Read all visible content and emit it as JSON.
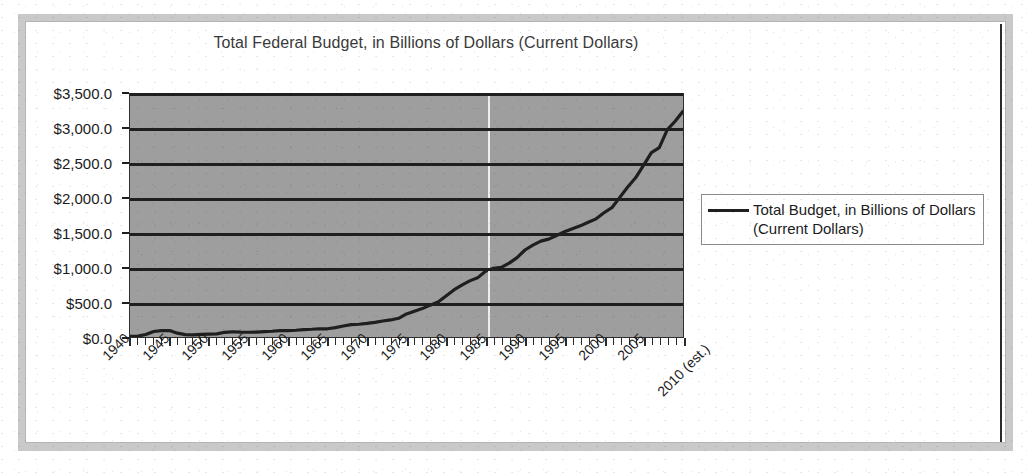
{
  "chart_data": {
    "type": "line",
    "title": "Total Federal Budget, in Billions of Dollars (Current Dollars)",
    "xlabel": "",
    "ylabel": "",
    "ylim": [
      0,
      3500
    ],
    "ytick_step": 500,
    "ytick_labels": [
      "$3,500.0",
      "$3,000.0",
      "$2,500.0",
      "$2,000.0",
      "$1,500.0",
      "$1,000.0",
      "$500.0",
      "$0.0"
    ],
    "ytick_values": [
      3500,
      3000,
      2500,
      2000,
      1500,
      1000,
      500,
      0
    ],
    "xtick_labels": [
      "1940",
      "1945",
      "1950",
      "1955",
      "1960",
      "1965",
      "1970",
      "1975",
      "1980",
      "1985",
      "1990",
      "1995",
      "2000",
      "2005",
      "2010 (est.)"
    ],
    "grid": "horizontal",
    "legend_position": "right",
    "plot_background": "#9e9e9e",
    "line_color": "#1f1f1f",
    "series": [
      {
        "name": "Total Budget, in Billions of Dollars (Current Dollars)",
        "x": [
          1940,
          1941,
          1942,
          1943,
          1944,
          1945,
          1946,
          1947,
          1948,
          1949,
          1950,
          1951,
          1952,
          1953,
          1954,
          1955,
          1956,
          1957,
          1958,
          1959,
          1960,
          1961,
          1962,
          1963,
          1964,
          1965,
          1966,
          1967,
          1968,
          1969,
          1970,
          1971,
          1972,
          1973,
          1974,
          1975,
          1976,
          1977,
          1978,
          1979,
          1980,
          1981,
          1982,
          1983,
          1984,
          1985,
          1986,
          1987,
          1988,
          1989,
          1990,
          1991,
          1992,
          1993,
          1994,
          1995,
          1996,
          1997,
          1998,
          1999,
          2000,
          2001,
          2002,
          2003,
          2004,
          2005,
          2006,
          2007,
          2008,
          2009,
          2010
        ],
        "values": [
          9.5,
          13.7,
          35.1,
          78.6,
          91.3,
          92.7,
          55.2,
          34.5,
          29.8,
          38.8,
          42.6,
          45.5,
          67.7,
          76.1,
          70.9,
          68.4,
          70.6,
          76.6,
          82.4,
          92.1,
          92.2,
          97.7,
          106.8,
          111.3,
          118.5,
          118.2,
          134.5,
          157.5,
          178.1,
          183.6,
          195.6,
          210.2,
          230.7,
          245.7,
          269.4,
          332.3,
          371.8,
          409.2,
          458.7,
          504.0,
          590.9,
          678.2,
          745.7,
          808.4,
          851.8,
          946.3,
          990.4,
          1004.0,
          1064.4,
          1143.7,
          1253.0,
          1324.2,
          1381.5,
          1409.4,
          1461.8,
          1515.7,
          1560.5,
          1601.1,
          1652.5,
          1701.8,
          1789.0,
          1862.8,
          2010.9,
          2159.9,
          2292.8,
          2472.0,
          2655.1,
          2728.7,
          2982.5,
          3107.4,
          3250.0
        ]
      }
    ]
  },
  "title": {
    "text": "Total Federal Budget, in Billions of Dollars (Current Dollars)"
  },
  "legend": {
    "label": "Total Budget, in Billions of Dollars (Current Dollars)"
  }
}
